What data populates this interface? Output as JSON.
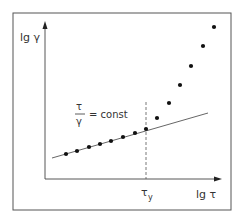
{
  "diagram": {
    "y_axis_label": "lg γ",
    "x_axis_label": "lg τ",
    "tick_label": "τ",
    "tick_subscript": "y",
    "annotation": {
      "numerator": "τ",
      "denominator": "γ",
      "rhs": "= const"
    },
    "colors": {
      "frame": "#555555",
      "axis": "#444444",
      "points": "#111111",
      "line": "#555555"
    },
    "linear_points": [
      [
        66,
        154
      ],
      [
        77,
        151
      ],
      [
        89,
        147
      ],
      [
        100,
        144
      ],
      [
        111,
        141
      ],
      [
        123,
        137
      ],
      [
        135,
        133
      ],
      [
        146,
        129
      ]
    ],
    "nonlinear_points": [
      [
        157,
        118
      ],
      [
        169,
        103
      ],
      [
        180,
        85
      ],
      [
        191,
        66
      ],
      [
        203,
        46
      ],
      [
        214,
        27
      ]
    ],
    "fit_line": {
      "x1": 52,
      "y1": 158,
      "x2": 208,
      "y2": 113
    },
    "yield_marker_x": 146
  }
}
